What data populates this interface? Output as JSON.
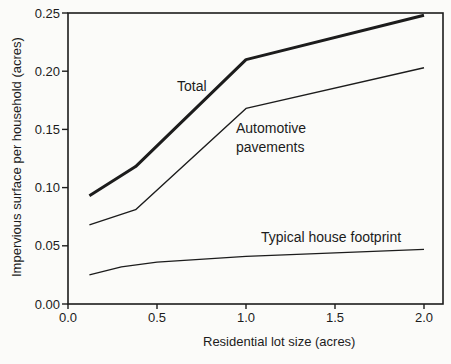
{
  "figure": {
    "background": "#fbfbf9",
    "ink": "#1c1c1c"
  },
  "chart_data": {
    "type": "line",
    "title": "",
    "xlabel": "Residential lot size (acres)",
    "ylabel": "Impervious surface per household (acres)",
    "xlim": [
      0.0,
      2.0
    ],
    "ylim": [
      0.0,
      0.25
    ],
    "x_ticks": [
      0.0,
      0.5,
      1.0,
      1.5,
      2.0
    ],
    "x_tick_labels": [
      "0.0",
      "0.5",
      "1.0",
      "1.5",
      "2.0"
    ],
    "y_ticks": [
      0.0,
      0.05,
      0.1,
      0.15,
      0.2,
      0.25
    ],
    "y_tick_labels": [
      "0.00",
      "0.05",
      "0.10",
      "0.15",
      "0.20",
      "0.25"
    ],
    "grid": false,
    "legend": "inline-annotations",
    "series": [
      {
        "name": "Total",
        "label": "Total",
        "stroke_width": 3,
        "x": [
          0.12,
          0.38,
          1.0,
          2.0
        ],
        "y": [
          0.093,
          0.118,
          0.21,
          0.248
        ]
      },
      {
        "name": "Automotive pavements",
        "label_lines": [
          "Automotive",
          "pavements"
        ],
        "stroke_width": 1.4,
        "x": [
          0.12,
          0.38,
          1.0,
          2.0
        ],
        "y": [
          0.068,
          0.081,
          0.168,
          0.203
        ]
      },
      {
        "name": "Typical house footprint",
        "label": "Typical house footprint",
        "stroke_width": 1.3,
        "x": [
          0.12,
          0.3,
          0.5,
          1.0,
          2.0
        ],
        "y": [
          0.025,
          0.032,
          0.036,
          0.041,
          0.047
        ]
      }
    ]
  }
}
